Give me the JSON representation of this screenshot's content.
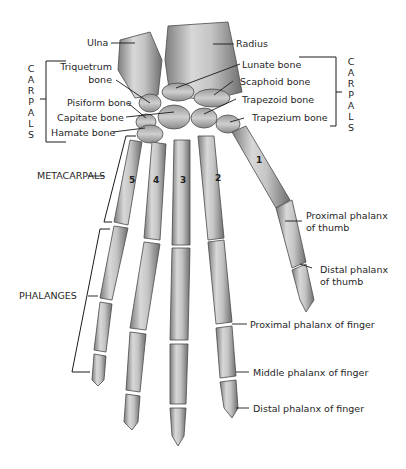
{
  "diagram": {
    "labels": {
      "ulna": "Ulna",
      "radius": "Radius",
      "triquetrum_1": "Triquetrum",
      "triquetrum_2": "bone",
      "pisiform": "Pisiform bone",
      "capitate": "Capitate bone",
      "hamate": "Hamate bone",
      "lunate": "Lunate bone",
      "scaphoid": "Scaphoid bone",
      "trapezoid": "Trapezoid bone",
      "trapezium": "Trapezium bone",
      "metacarpals": "METACARPALS",
      "phalanges": "PHALANGES",
      "proximal_thumb_1": "Proximal phalanx",
      "proximal_thumb_2": "of thumb",
      "distal_thumb_1": "Distal phalanx",
      "distal_thumb_2": "of thumb",
      "proximal_finger": "Proximal phalanx of finger",
      "middle_finger": "Middle phalanx of finger",
      "distal_finger": "Distal phalanx of finger"
    },
    "group_left": {
      "letters": [
        "C",
        "A",
        "R",
        "P",
        "A",
        "L",
        "S"
      ]
    },
    "group_right": {
      "letters": [
        "C",
        "A",
        "R",
        "P",
        "A",
        "L",
        "S"
      ]
    },
    "metacarpal_numbers": {
      "one": "1",
      "two": "2",
      "three": "3",
      "four": "4",
      "five": "5"
    },
    "colors": {
      "bone_fill": "#c9c9c9",
      "bone_shade": "#8a8a8a",
      "bone_outline": "#4a4a4a",
      "leader_line": "#1a1a1a",
      "background": "#ffffff"
    }
  }
}
